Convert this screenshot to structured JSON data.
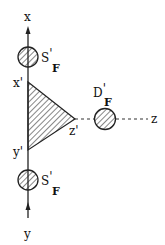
{
  "diagram": {
    "axes": {
      "x_label": "x",
      "y_label": "y",
      "z_label": "z"
    },
    "vertices": {
      "x_prime": "x'",
      "y_prime": "y'",
      "z_prime": "z'"
    },
    "sources": {
      "upper": {
        "main": "S",
        "prime": "'",
        "sub": "F"
      },
      "lower": {
        "main": "S",
        "prime": "'",
        "sub": "F"
      },
      "detector": {
        "main": "D",
        "prime": "'",
        "sub": "F"
      }
    },
    "colors": {
      "line": "#222222",
      "background": "#ffffff"
    }
  }
}
